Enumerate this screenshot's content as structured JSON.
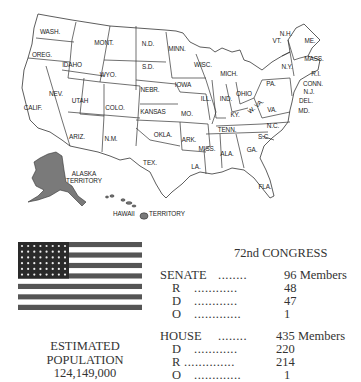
{
  "map": {
    "title": "United States (48 states + territories)",
    "state_labels": [
      {
        "id": "wa",
        "text": "WASH.",
        "x": 50,
        "y": 34
      },
      {
        "id": "or",
        "text": "OREG.",
        "x": 42,
        "y": 57
      },
      {
        "id": "id",
        "text": "IDAHO",
        "x": 72,
        "y": 67
      },
      {
        "id": "mt",
        "text": "MONT.",
        "x": 104,
        "y": 45
      },
      {
        "id": "wy",
        "text": "WYO.",
        "x": 108,
        "y": 77
      },
      {
        "id": "nd",
        "text": "N.D.",
        "x": 148,
        "y": 46
      },
      {
        "id": "sd",
        "text": "S.D.",
        "x": 148,
        "y": 69
      },
      {
        "id": "ne",
        "text": "NEBR.",
        "x": 150,
        "y": 92
      },
      {
        "id": "ks",
        "text": "KANSAS",
        "x": 153,
        "y": 114
      },
      {
        "id": "ok",
        "text": "OKLA.",
        "x": 163,
        "y": 137
      },
      {
        "id": "tx",
        "text": "TEX.",
        "x": 150,
        "y": 165
      },
      {
        "id": "nm",
        "text": "N.M.",
        "x": 111,
        "y": 141
      },
      {
        "id": "az",
        "text": "ARIZ.",
        "x": 77,
        "y": 139
      },
      {
        "id": "co",
        "text": "COLO.",
        "x": 115,
        "y": 110
      },
      {
        "id": "ut",
        "text": "UTAH",
        "x": 80,
        "y": 103
      },
      {
        "id": "nv",
        "text": "NEV.",
        "x": 56,
        "y": 96
      },
      {
        "id": "ca",
        "text": "CALIF.",
        "x": 33,
        "y": 110
      },
      {
        "id": "mn",
        "text": "MINN.",
        "x": 177,
        "y": 51
      },
      {
        "id": "ia",
        "text": "IOWA",
        "x": 183,
        "y": 87
      },
      {
        "id": "mo",
        "text": "MO.",
        "x": 187,
        "y": 116
      },
      {
        "id": "ar",
        "text": "ARK.",
        "x": 189,
        "y": 142
      },
      {
        "id": "la",
        "text": "LA.",
        "x": 196,
        "y": 169
      },
      {
        "id": "wi",
        "text": "WISC.",
        "x": 203,
        "y": 67
      },
      {
        "id": "il",
        "text": "ILL.",
        "x": 206,
        "y": 101
      },
      {
        "id": "ms",
        "text": "MISS.",
        "x": 207,
        "y": 151
      },
      {
        "id": "mi",
        "text": "MICH.",
        "x": 229,
        "y": 76
      },
      {
        "id": "in",
        "text": "IND.",
        "x": 226,
        "y": 101
      },
      {
        "id": "oh",
        "text": "OHIO",
        "x": 244,
        "y": 96
      },
      {
        "id": "ky",
        "text": "KY.",
        "x": 235,
        "y": 117
      },
      {
        "id": "tn",
        "text": "TENN.",
        "x": 227,
        "y": 132
      },
      {
        "id": "al",
        "text": "ALA.",
        "x": 227,
        "y": 156
      },
      {
        "id": "ga",
        "text": "GA.",
        "x": 252,
        "y": 152
      },
      {
        "id": "sc",
        "text": "S.C.",
        "x": 264,
        "y": 139
      },
      {
        "id": "nc",
        "text": "N.C.",
        "x": 273,
        "y": 128
      },
      {
        "id": "va",
        "text": "VA.",
        "x": 272,
        "y": 112
      },
      {
        "id": "wv",
        "text": "W. VA.",
        "x": 257,
        "y": 108
      },
      {
        "id": "pa",
        "text": "PA.",
        "x": 271,
        "y": 86
      },
      {
        "id": "ny",
        "text": "N.Y.",
        "x": 287,
        "y": 69
      },
      {
        "id": "vt",
        "text": "VT.",
        "x": 277,
        "y": 43
      },
      {
        "id": "nh",
        "text": "N.H.",
        "x": 286,
        "y": 36
      },
      {
        "id": "me",
        "text": "ME.",
        "x": 310,
        "y": 43
      },
      {
        "id": "ma",
        "text": "MASS.",
        "x": 314,
        "y": 61
      },
      {
        "id": "ri",
        "text": "R.I.",
        "x": 316,
        "y": 76
      },
      {
        "id": "ct",
        "text": "CONN.",
        "x": 313,
        "y": 86
      },
      {
        "id": "nj",
        "text": "N.J.",
        "x": 309,
        "y": 94
      },
      {
        "id": "de",
        "text": "DEL.",
        "x": 306,
        "y": 103
      },
      {
        "id": "md",
        "text": "MD.",
        "x": 304,
        "y": 113
      },
      {
        "id": "fl",
        "text": "FLA.",
        "x": 265,
        "y": 189
      }
    ],
    "territory_labels": [
      {
        "id": "ak",
        "line1": "ALASKA",
        "line2": "TERRITORY",
        "x": 84,
        "y": 176
      },
      {
        "id": "hi",
        "text_left": "HAWAII",
        "text_right": "TERRITORY",
        "x": 113,
        "y": 216
      }
    ],
    "colors": {
      "territory_fill": "#7a7a7a",
      "state_fill": "#ffffff",
      "border": "#333333"
    }
  },
  "flag": {
    "stars": 48,
    "star_rows": 6,
    "star_cols": 8,
    "stripes": 13,
    "colors": {
      "stripe_dark": "#555555",
      "stripe_light": "#ffffff",
      "canton": "#2a2a2a",
      "star": "#eeeeee"
    }
  },
  "population": {
    "line1": "ESTIMATED",
    "line2": "POPULATION",
    "value": "124,149,000"
  },
  "congress": {
    "title": "72nd CONGRESS",
    "senate": {
      "label": "SENATE",
      "dots": "........",
      "total": "96 Members",
      "rows": [
        {
          "party": "R",
          "dots": "............",
          "count": "48"
        },
        {
          "party": "D",
          "dots": "............",
          "count": "47"
        },
        {
          "party": "O",
          "dots": ".............",
          "count": "1"
        }
      ]
    },
    "house": {
      "label": "HOUSE",
      "dots": "........",
      "total": "435 Members",
      "rows": [
        {
          "party": "D",
          "dots": "............",
          "count": "220"
        },
        {
          "party": "R",
          "dots": "..............",
          "count": "214"
        },
        {
          "party": "O",
          "dots": ".............",
          "count": "1"
        }
      ]
    }
  }
}
